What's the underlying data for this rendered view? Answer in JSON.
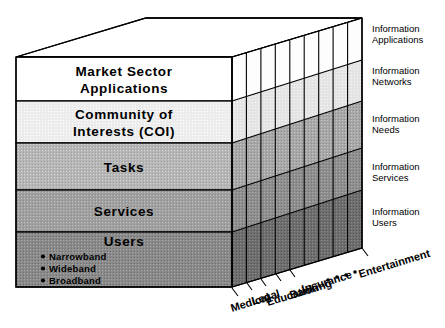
{
  "diagram": {
    "front_layers": [
      {
        "id": "market-sector-applications",
        "line1": "Market  Sector",
        "line2": "Applications",
        "fill": "#ffffff"
      },
      {
        "id": "community-of-interests",
        "line1": "Community  of",
        "line2": "Interests  (COI)",
        "fill": "#ececec"
      },
      {
        "id": "tasks",
        "line1": "Tasks",
        "line2": "",
        "fill": "#b6b6b6"
      },
      {
        "id": "services",
        "line1": "Services",
        "line2": "",
        "fill": "#a0a0a0"
      },
      {
        "id": "users",
        "line1": "Users",
        "line2": "",
        "fill": "#8a8a8a"
      }
    ],
    "users_bullets": [
      "Narrowband",
      "Wideband",
      "Broadband"
    ],
    "right_labels": [
      {
        "id": "information-applications",
        "line1": "Information",
        "line2": "Applications"
      },
      {
        "id": "information-networks",
        "line1": "Information",
        "line2": "Networks"
      },
      {
        "id": "information-needs",
        "line1": "Information",
        "line2": "Needs"
      },
      {
        "id": "information-services",
        "line1": "Information",
        "line2": "Services"
      },
      {
        "id": "information-users",
        "line1": "Information",
        "line2": "Users"
      }
    ],
    "depth_axis_labels": [
      "Medical",
      "Legal",
      "Education",
      "Banking",
      "Insurance",
      "Entertainment"
    ],
    "ellipsis_dots": 4,
    "colors": {
      "outline": "#000000",
      "layer_1": "#ffffff",
      "layer_2": "#ececec",
      "layer_3": "#b6b6b6",
      "layer_4": "#a0a0a0",
      "layer_5": "#8a8a8a",
      "side_layer_1": "#fcfcfc",
      "side_layer_2": "#e2e2e2",
      "side_layer_3": "#a8a8a8",
      "side_layer_4": "#8e8e8e",
      "side_layer_5": "#6e6e6e",
      "top_face": "#ffffff",
      "background": "#ffffff"
    }
  }
}
